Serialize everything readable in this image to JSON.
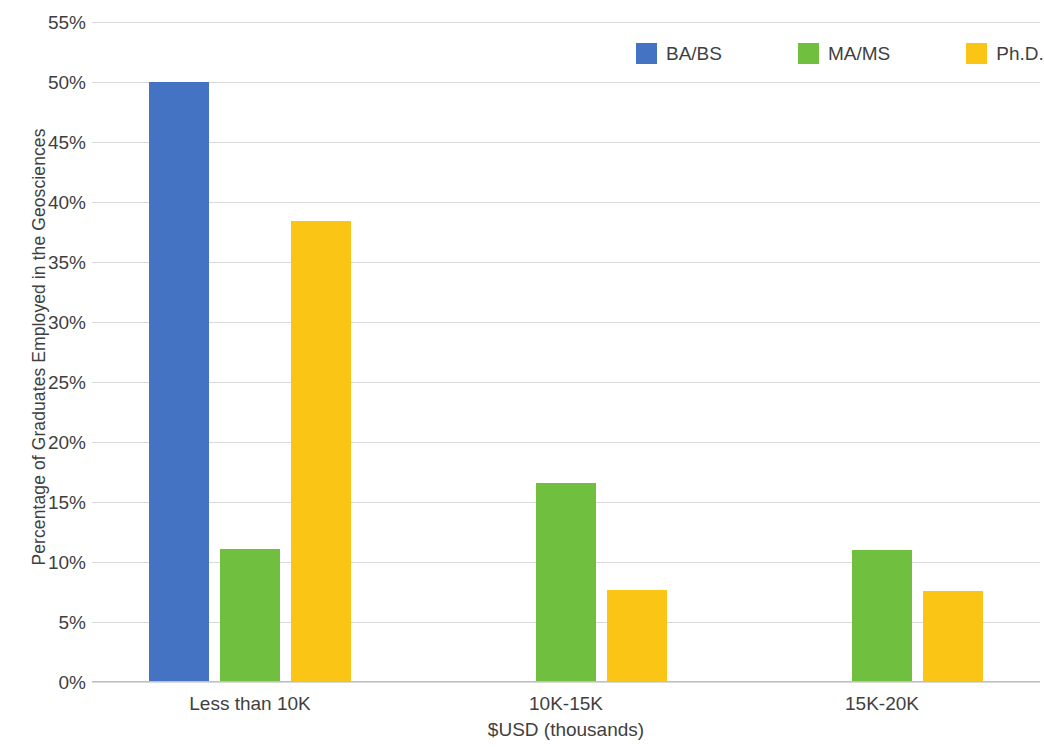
{
  "chart_data": {
    "type": "bar",
    "title": "",
    "subtitle": "",
    "xlabel": "$USD (thousands)",
    "ylabel": "Percentage of Graduates Employed in the Geosciences",
    "categories": [
      "Less than 10K",
      "10K-15K",
      "15K-20K"
    ],
    "series": [
      {
        "name": "BA/BS",
        "color": "#4573c4",
        "values": [
          50.0,
          0,
          0
        ]
      },
      {
        "name": "MA/MS",
        "color": "#70bf3f",
        "values": [
          11.1,
          16.6,
          11.0
        ]
      },
      {
        "name": "Ph.D.",
        "color": "#fbc516",
        "values": [
          38.4,
          7.7,
          7.6
        ]
      }
    ],
    "ylim": [
      0,
      55
    ],
    "ytick_step": 5,
    "ytick_labels": [
      "0%",
      "5%",
      "10%",
      "15%",
      "20%",
      "25%",
      "30%",
      "35%",
      "40%",
      "45%",
      "50%",
      "55%"
    ],
    "ytick_values": [
      0,
      5,
      10,
      15,
      20,
      25,
      30,
      35,
      40,
      45,
      50,
      55
    ],
    "grid": true,
    "legend_position": "top-right",
    "value_suffix": "%"
  },
  "legend": {
    "items": [
      {
        "label": "BA/BS",
        "color": "#4573c4"
      },
      {
        "label": "MA/MS",
        "color": "#70bf3f"
      },
      {
        "label": "Ph.D.",
        "color": "#fbc516"
      }
    ]
  }
}
